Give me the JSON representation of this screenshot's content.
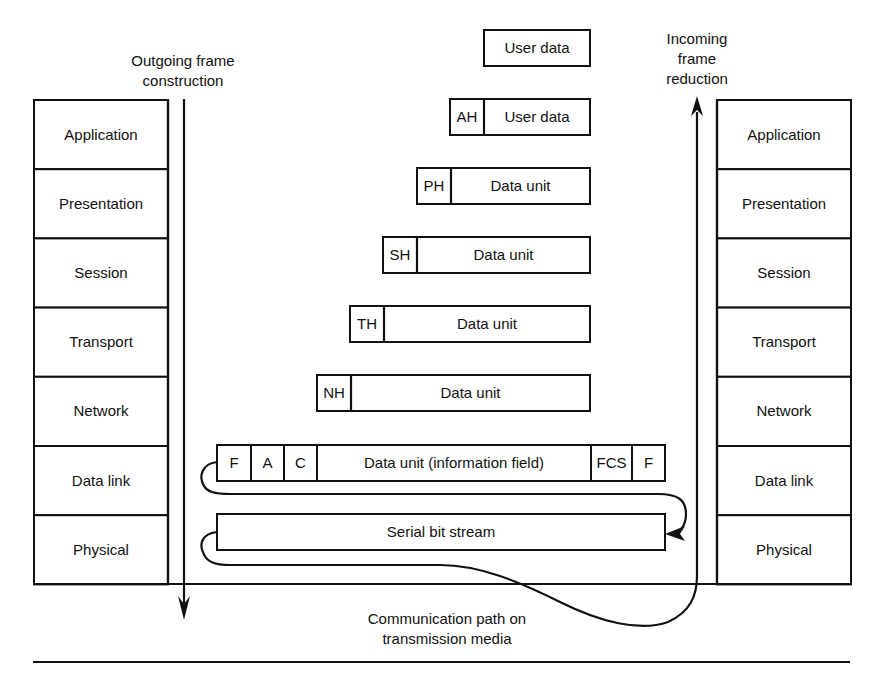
{
  "captions": {
    "outgoing": [
      "Outgoing frame",
      "construction"
    ],
    "incoming": [
      "Incoming",
      "frame",
      "reduction"
    ],
    "media": [
      "Communication path on",
      "transmission media"
    ]
  },
  "layers": [
    "Application",
    "Presentation",
    "Session",
    "Transport",
    "Network",
    "Data link",
    "Physical"
  ],
  "units": [
    {
      "header": "",
      "body": "User data"
    },
    {
      "header": "AH",
      "body": "User data"
    },
    {
      "header": "PH",
      "body": "Data unit"
    },
    {
      "header": "SH",
      "body": "Data unit"
    },
    {
      "header": "TH",
      "body": "Data unit"
    },
    {
      "header": "NH",
      "body": "Data unit"
    }
  ],
  "frame": {
    "fields": [
      "F",
      "A",
      "C",
      "Data unit (information field)",
      "FCS",
      "F"
    ]
  },
  "bitstream": "Serial bit stream",
  "icons": {
    "outgoing_arrow": "arrow-down-icon",
    "incoming_arrow": "arrow-up-icon"
  }
}
